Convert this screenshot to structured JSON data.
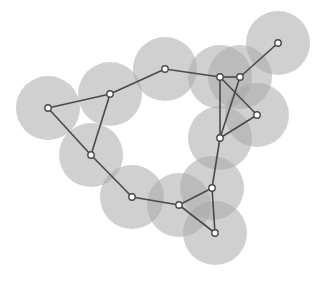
{
  "diagram": {
    "type": "unit-disk-graph",
    "width": 331,
    "height": 285,
    "circle_radius": 32,
    "node_radius": 3.2,
    "colors": {
      "background": "#ffffff",
      "circle_fill": "#a9a9a9",
      "edge": "#4a4a4a",
      "node_fill": "#ffffff",
      "node_stroke": "#4a4a4a"
    },
    "nodes": [
      {
        "id": "n1",
        "x": 48,
        "y": 108
      },
      {
        "id": "n2",
        "x": 110,
        "y": 94
      },
      {
        "id": "n3",
        "x": 165,
        "y": 69
      },
      {
        "id": "n4",
        "x": 220,
        "y": 77
      },
      {
        "id": "n5",
        "x": 240,
        "y": 77
      },
      {
        "id": "n6",
        "x": 278,
        "y": 43
      },
      {
        "id": "n7",
        "x": 257,
        "y": 115
      },
      {
        "id": "n8",
        "x": 220,
        "y": 138
      },
      {
        "id": "n9",
        "x": 91,
        "y": 155
      },
      {
        "id": "n10",
        "x": 132,
        "y": 197
      },
      {
        "id": "n11",
        "x": 179,
        "y": 205
      },
      {
        "id": "n12",
        "x": 212,
        "y": 188
      },
      {
        "id": "n13",
        "x": 215,
        "y": 233
      }
    ],
    "edges": [
      [
        "n1",
        "n2"
      ],
      [
        "n1",
        "n9"
      ],
      [
        "n2",
        "n9"
      ],
      [
        "n2",
        "n3"
      ],
      [
        "n3",
        "n4"
      ],
      [
        "n4",
        "n5"
      ],
      [
        "n5",
        "n6"
      ],
      [
        "n4",
        "n8"
      ],
      [
        "n4",
        "n7"
      ],
      [
        "n5",
        "n8"
      ],
      [
        "n7",
        "n8"
      ],
      [
        "n8",
        "n12"
      ],
      [
        "n9",
        "n10"
      ],
      [
        "n10",
        "n11"
      ],
      [
        "n11",
        "n12"
      ],
      [
        "n11",
        "n13"
      ],
      [
        "n12",
        "n13"
      ]
    ]
  }
}
